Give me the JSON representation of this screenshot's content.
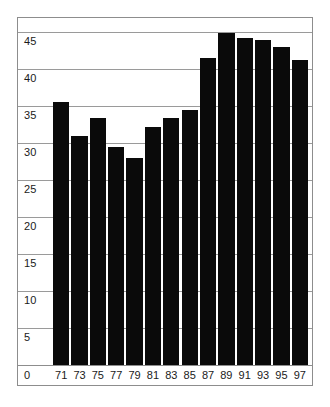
{
  "chart_data": {
    "type": "bar",
    "title": "",
    "subtitle": "",
    "xlabel": "",
    "ylabel": "",
    "categories": [
      "71",
      "73",
      "75",
      "77",
      "79",
      "81",
      "83",
      "85",
      "87",
      "89",
      "91",
      "93",
      "95",
      "97"
    ],
    "values": [
      35.5,
      31.0,
      33.4,
      29.5,
      28.0,
      32.2,
      33.4,
      34.5,
      41.5,
      44.8,
      44.2,
      43.9,
      43.0,
      41.2
    ],
    "series": [
      {
        "name": "",
        "values": [
          35.5,
          31.0,
          33.4,
          29.5,
          28.0,
          32.2,
          33.4,
          34.5,
          41.5,
          44.8,
          44.2,
          43.9,
          43.0,
          41.2
        ]
      }
    ],
    "ylim": [
      0,
      47
    ],
    "xlim": [
      0,
      14
    ],
    "yticks": [
      0,
      5,
      10,
      15,
      20,
      25,
      30,
      35,
      40,
      45
    ],
    "ytick_labels": [
      "0",
      "5",
      "10",
      "15",
      "20",
      "25",
      "30",
      "35",
      "40",
      "45"
    ],
    "xtick_labels": [
      "71",
      "73",
      "75",
      "77",
      "79",
      "81",
      "83",
      "85",
      "87",
      "89",
      "91",
      "93",
      "95",
      "97"
    ],
    "grid": true,
    "grid_axis": "y",
    "legend": false,
    "legend_position": "none",
    "annotations": [],
    "colors": {
      "bar": "#0a0a0a",
      "gridline": "#9a9a9a",
      "frame": "#8d8d8d",
      "background": "#ffffff",
      "text": "#1a1a1a"
    }
  },
  "origin_label": "0"
}
